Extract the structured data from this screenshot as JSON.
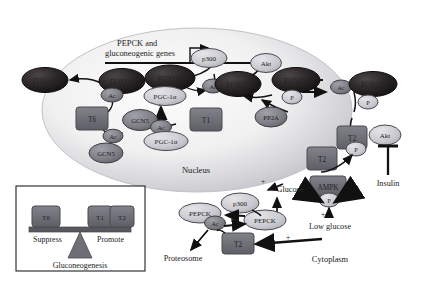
{
  "figure": {
    "type": "biological-pathway-diagram",
    "compartments": [
      {
        "id": "nucleus",
        "label": "Nucleus"
      },
      {
        "id": "cytoplasm",
        "label": "Cytoplasm"
      }
    ]
  },
  "nucleus": {
    "label": "Nucleus",
    "gene_label_line1": "PEPCK and",
    "gene_label_line2": "gluconeogenic genes",
    "nodes": {
      "foxo1_exported": "FOXO1",
      "foxo1_ac_left": "FOXO1",
      "ac_left": "Ac",
      "t6": "T6",
      "gcn5_lower": "GCN5",
      "ac_gcn5": "Ac",
      "gcn5_mid": "GCN5",
      "foxo1_promoter": "FOXO1",
      "pgc1a_top": "PGC-1α",
      "pgc1a_bottom": "PGC-1α",
      "ac_pgc": "Ac",
      "t1": "T1",
      "p300": "p300",
      "ac_mid": "Ac",
      "foxo1_mid": "FOXO1",
      "akt_nuc": "Akt",
      "foxo1_p": "FOXO1",
      "p_nuc": "P",
      "pp2a": "PP2A"
    }
  },
  "cytoplasm": {
    "label": "Cytoplasm",
    "nodes": {
      "ac_cyto": "Ac",
      "foxo1_cyto": "FOXO1",
      "p_cyto": "P",
      "t2_akt": "T2",
      "akt_cyto": "Akt",
      "p_akt": "P",
      "t2_mid": "T2",
      "ampk": "AMPK",
      "p_ampk": "P",
      "p300_cyto": "p300",
      "pepck_right": "PEPCK",
      "pepck_left": "PEPCK",
      "ac_pepck": "Ac",
      "t2_low": "T2"
    },
    "labels": {
      "insulin": "Insulin",
      "glucose": "Glucose",
      "low_glucose": "Low glucose",
      "proteosome": "Proteosome"
    },
    "signs": {
      "plus": "+"
    }
  },
  "legend": {
    "left_block": "T6",
    "right_block_1": "T1",
    "right_block_2": "T2",
    "left_label": "Suppress",
    "right_label": "Promote",
    "fulcrum_label": "Gluconeogenesis"
  },
  "colors": {
    "dark_node": "#231f20",
    "mid_gray_node": "#7d7d85",
    "light_node": "#c9c9cf",
    "block_gray": "#6e6e76",
    "nucleus_edge": "#bdbdc2",
    "nucleus_fill": "#f2f2f3",
    "stroke": "#111111",
    "text_light": "#ffffff",
    "text_dark": "#1a1a1a"
  }
}
